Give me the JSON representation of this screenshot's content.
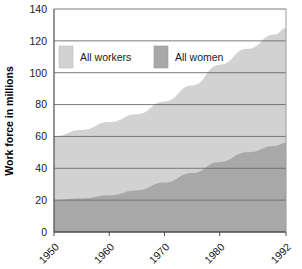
{
  "chart_data": {
    "type": "area",
    "title": "",
    "subtitle": "",
    "xlabel": "",
    "ylabel": "Work force in millions",
    "xlim": [
      1950,
      1992
    ],
    "ylim": [
      0,
      140
    ],
    "ytick_values": [
      0,
      20,
      40,
      60,
      80,
      100,
      120,
      140
    ],
    "ytick_labels": [
      "0",
      "20",
      "40",
      "60",
      "80",
      "100",
      "120",
      "140"
    ],
    "xtick_values": [
      1950,
      1960,
      1970,
      1980,
      1992
    ],
    "xtick_labels": [
      "1950",
      "1960",
      "1970",
      "1980",
      "1992"
    ],
    "xtick_label_rotation": -45,
    "grid": "horizontal",
    "stacked": false,
    "legend_position": "inside-top-left",
    "legend": [
      {
        "name": "All workers",
        "color": "#d2d2d2"
      },
      {
        "name": "All women",
        "color": "#a8a8a8"
      }
    ],
    "x": [
      1950,
      1955,
      1960,
      1965,
      1970,
      1975,
      1980,
      1985,
      1990,
      1992
    ],
    "series": [
      {
        "name": "All workers",
        "color": "#d2d2d2",
        "values": [
          60,
          64,
          69,
          74,
          82,
          92,
          105,
          115,
          124,
          128
        ]
      },
      {
        "name": "All women",
        "color": "#a8a8a8",
        "values": [
          20,
          21,
          23,
          26,
          31,
          37,
          44,
          50,
          54,
          56
        ]
      }
    ]
  },
  "legend": {
    "workers_label": "All workers",
    "women_label": "All women"
  },
  "axes": {
    "ylabel": "Work force in millions"
  }
}
